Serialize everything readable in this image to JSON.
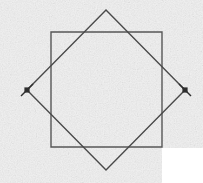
{
  "figure": {
    "canvas": {
      "width": 203,
      "height": 183
    },
    "background": {
      "paper_color": "#e7e7e7",
      "paper_highlight": "#f2f2f2",
      "texture": "paper-grain-noise",
      "white_patch": {
        "name": "bottom-right-white-region",
        "x": 162,
        "y": 148,
        "width": 41,
        "height": 35,
        "color": "#ffffff"
      }
    },
    "stroke": {
      "color": "#4a4a4a",
      "dark_color": "#2e2e2e",
      "width": 1.4
    },
    "shapes": [
      {
        "name": "axis-aligned-square",
        "type": "polygon",
        "label": "Upright square",
        "points": [
          {
            "x": 51,
            "y": 32
          },
          {
            "x": 162,
            "y": 32
          },
          {
            "x": 162,
            "y": 147
          },
          {
            "x": 51,
            "y": 147
          }
        ],
        "side_length": 113,
        "rotation_deg": 0,
        "stroke": "#575757",
        "fill": "none"
      },
      {
        "name": "rotated-square-diamond",
        "type": "polygon",
        "label": "Rotated square (diamond)",
        "points": [
          {
            "x": 106,
            "y": 10
          },
          {
            "x": 185,
            "y": 90
          },
          {
            "x": 106,
            "y": 170
          },
          {
            "x": 27,
            "y": 90
          }
        ],
        "side_length": 112,
        "rotation_deg": 45,
        "stroke": "#4a4a4a",
        "fill": "none"
      }
    ],
    "markers": [
      {
        "name": "vertex-marker-left",
        "type": "x-mark-with-dot",
        "x": 27,
        "y": 90,
        "dot_radius": 2.6,
        "tick_length": 17,
        "tick_angle_deg": -45,
        "color": "#2e2e2e",
        "description": "Left vertex of diamond marked with a dot and a short crossing tick"
      },
      {
        "name": "vertex-marker-right",
        "type": "x-mark-with-dot",
        "x": 185,
        "y": 90,
        "dot_radius": 2.6,
        "tick_length": 17,
        "tick_angle_deg": 45,
        "color": "#2e2e2e",
        "description": "Right vertex of diamond marked with a dot and a short crossing tick"
      }
    ],
    "vertices": [
      {
        "name": "diamond-top",
        "x": 106,
        "y": 10
      },
      {
        "name": "diamond-right",
        "x": 185,
        "y": 90
      },
      {
        "name": "diamond-bottom",
        "x": 106,
        "y": 170
      },
      {
        "name": "diamond-left",
        "x": 27,
        "y": 90
      },
      {
        "name": "square-top-left",
        "x": 51,
        "y": 32
      },
      {
        "name": "square-top-right",
        "x": 162,
        "y": 32
      },
      {
        "name": "square-bottom-right",
        "x": 162,
        "y": 147
      },
      {
        "name": "square-bottom-left",
        "x": 51,
        "y": 147
      }
    ],
    "labels": []
  }
}
